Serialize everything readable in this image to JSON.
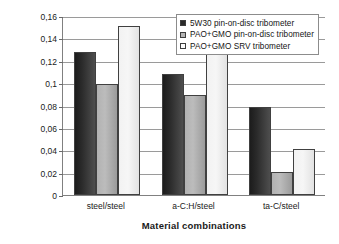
{
  "chart_data": {
    "type": "bar",
    "title": "",
    "xlabel": "Material combinations",
    "ylabel": "Friction coefficient",
    "categories": [
      "steel/steel",
      "a-C:H/steel",
      "ta-C/steel"
    ],
    "series": [
      {
        "name": "5W30  pin-on-disc tribometer",
        "color": "#2a2a2a",
        "values": [
          0.128,
          0.108,
          0.079
        ]
      },
      {
        "name": "PAO+GMO  pin-on-disc tribometer",
        "color": "#b4b4b4",
        "values": [
          0.099,
          0.089,
          0.021
        ]
      },
      {
        "name": "PAO+GMO SRV tribometer",
        "color": "#fbfbfb",
        "values": [
          0.151,
          0.128,
          0.041
        ]
      }
    ],
    "ylim": [
      0,
      0.16
    ],
    "ytick_values": [
      0,
      0.02,
      0.04,
      0.06,
      0.08,
      0.1,
      0.12,
      0.14,
      0.16
    ],
    "ytick_labels": [
      "0",
      "0,02",
      "0,04",
      "0,06",
      "0,08",
      "0,1",
      "0,12",
      "0,14",
      "0,16"
    ],
    "grid": true,
    "legend_position": "top-right",
    "decimal_separator": ","
  }
}
